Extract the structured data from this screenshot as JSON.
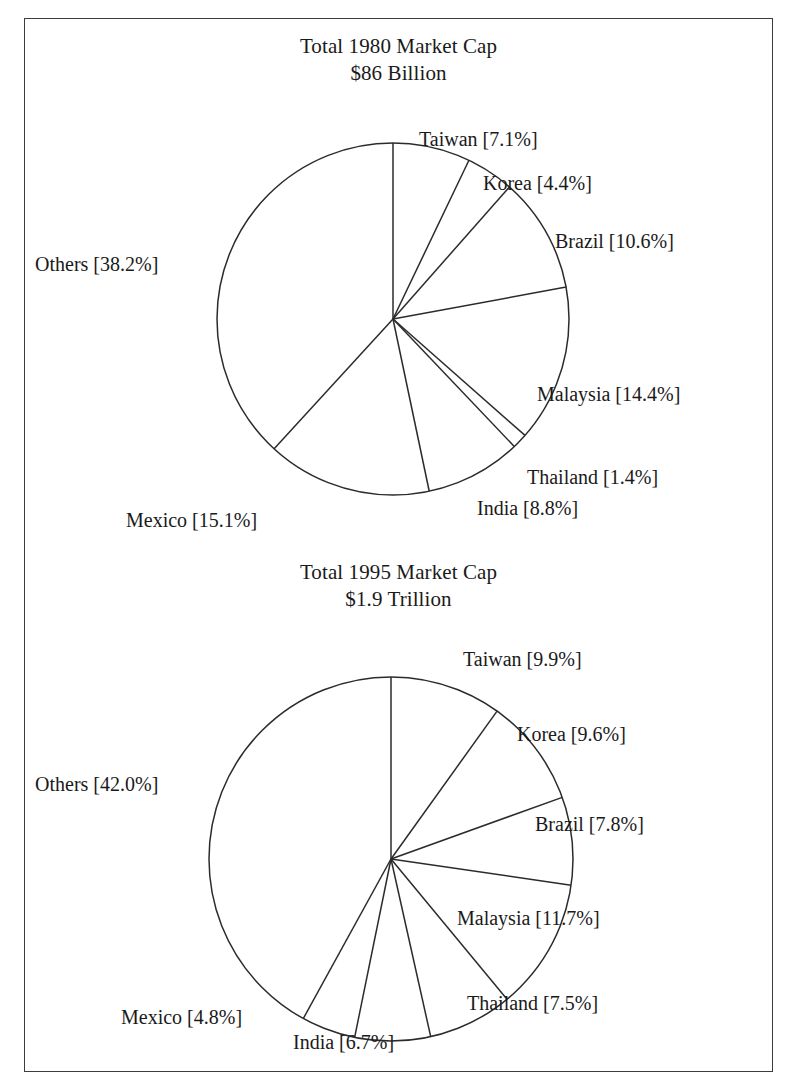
{
  "figure": {
    "background_color": "#ffffff",
    "frame_color": "#3c3c3c",
    "line_color": "#2b2b2b"
  },
  "chart_data": [
    {
      "type": "pie",
      "title": "Total 1980 Market Cap\n$86 Billion",
      "title_line1": "Total 1980 Market Cap",
      "title_line2": "$86 Billion",
      "total_label": "$86 Billion",
      "year": "1980",
      "units": "percent of total market capitalization",
      "start_angle_deg": 0,
      "direction": "clockwise",
      "categories": [
        "Taiwan",
        "Korea",
        "Brazil",
        "Malaysia",
        "Thailand",
        "India",
        "Mexico",
        "Others"
      ],
      "values": [
        7.1,
        4.4,
        10.6,
        14.4,
        1.4,
        8.8,
        15.1,
        38.2
      ],
      "labels": [
        "Taiwan [7.1%]",
        "Korea [4.4%]",
        "Brazil [10.6%]",
        "Malaysia [14.4%]",
        "Thailand [1.4%]",
        "India [8.8%]",
        "Mexico [15.1%]",
        "Others [38.2%]"
      ],
      "label_positions": [
        {
          "x": 394,
          "y": 108,
          "anchor": "start"
        },
        {
          "x": 458,
          "y": 152,
          "anchor": "start"
        },
        {
          "x": 530,
          "y": 210,
          "anchor": "start"
        },
        {
          "x": 512,
          "y": 363,
          "anchor": "start"
        },
        {
          "x": 502,
          "y": 446,
          "anchor": "start"
        },
        {
          "x": 452,
          "y": 477,
          "anchor": "start"
        },
        {
          "x": 101,
          "y": 489,
          "anchor": "start"
        },
        {
          "x": 10,
          "y": 233,
          "anchor": "start"
        }
      ],
      "geometry": {
        "cx": 368,
        "cy": 300,
        "r": 176
      }
    },
    {
      "type": "pie",
      "title": "Total 1995 Market Cap\n$1.9 Trillion",
      "title_line1": "Total 1995 Market Cap",
      "title_line2": "$1.9 Trillion",
      "total_label": "$1.9 Trillion",
      "year": "1995",
      "units": "percent of total market capitalization",
      "start_angle_deg": 0,
      "direction": "clockwise",
      "categories": [
        "Taiwan",
        "Korea",
        "Brazil",
        "Malaysia",
        "Thailand",
        "India",
        "Mexico",
        "Others"
      ],
      "values": [
        9.9,
        9.6,
        7.8,
        11.7,
        7.5,
        6.7,
        4.8,
        42.0
      ],
      "labels": [
        "Taiwan [9.9%]",
        "Korea [9.6%]",
        "Brazil [7.8%]",
        "Malaysia [11.7%]",
        "Thailand [7.5%]",
        "India [6.7%]",
        "Mexico [4.8%]",
        "Others [42.0%]"
      ],
      "label_positions": [
        {
          "x": 438,
          "y": 108,
          "anchor": "start"
        },
        {
          "x": 492,
          "y": 183,
          "anchor": "start"
        },
        {
          "x": 510,
          "y": 273,
          "anchor": "start"
        },
        {
          "x": 432,
          "y": 367,
          "anchor": "start"
        },
        {
          "x": 442,
          "y": 452,
          "anchor": "start"
        },
        {
          "x": 268,
          "y": 491,
          "anchor": "start"
        },
        {
          "x": 96,
          "y": 466,
          "anchor": "start"
        },
        {
          "x": 10,
          "y": 233,
          "anchor": "start"
        }
      ],
      "geometry": {
        "cx": 366,
        "cy": 320,
        "r": 182
      }
    }
  ]
}
